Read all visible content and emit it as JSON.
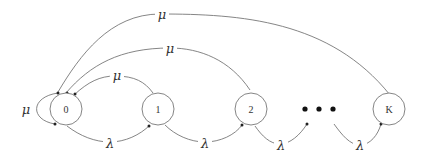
{
  "diagram": {
    "type": "state-transition-diagram",
    "nodes": [
      {
        "id": "n0",
        "label": "0"
      },
      {
        "id": "n1",
        "label": "1"
      },
      {
        "id": "n2",
        "label": "2"
      },
      {
        "id": "nK",
        "label": "K"
      }
    ],
    "ellipsis": "• • •",
    "edges": {
      "arrival_label": "λ",
      "service_label": "μ",
      "arrivals": [
        {
          "from": "0",
          "to": "1",
          "label": "λ"
        },
        {
          "from": "1",
          "to": "2",
          "label": "λ"
        },
        {
          "from": "2",
          "to": "…",
          "label": "λ"
        },
        {
          "from": "…",
          "to": "K",
          "label": "λ"
        }
      ],
      "services": [
        {
          "from": "0",
          "to": "0",
          "label": "μ"
        },
        {
          "from": "1",
          "to": "0",
          "label": "μ"
        },
        {
          "from": "2",
          "to": "0",
          "label": "μ"
        },
        {
          "from": "K",
          "to": "0",
          "label": "μ"
        }
      ]
    }
  }
}
